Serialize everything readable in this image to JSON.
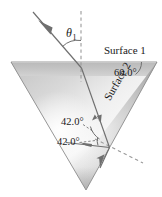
{
  "figure": {
    "canvas": {
      "width": 162,
      "height": 197
    },
    "background_color": "#ffffff"
  },
  "prism": {
    "shape": "inverted-triangle",
    "fill_light": "#f4f4f4",
    "fill_mid": "#d0d0d0",
    "fill_dark": "#a8a8a8",
    "outline_color": "#8a8a8a",
    "vertices": [
      {
        "name": "top-left",
        "x": 11,
        "y": 62
      },
      {
        "name": "top-right",
        "x": 157,
        "y": 62
      },
      {
        "name": "bottom",
        "x": 86,
        "y": 190
      }
    ]
  },
  "labels": {
    "surface_1": "Surface 1",
    "surface_2": "Surface 2",
    "angle_60": "60.0°",
    "angle_42_upper": "42.0°",
    "angle_42_lower": "42.0°",
    "theta_1_symbol": "θ",
    "theta_1_subscript": "1"
  },
  "rays": {
    "incident": {
      "name": "incident-ray",
      "from": {
        "x": 33,
        "y": 12
      },
      "to": {
        "x": 81,
        "y": 68
      },
      "arrow_at": {
        "x": 48,
        "y": 30
      },
      "color": "#6f6f6f"
    },
    "refracted_inside": {
      "name": "refracted-ray-inside-prism",
      "from": {
        "x": 81,
        "y": 68
      },
      "to": {
        "x": 109,
        "y": 147
      },
      "arrow_at": {
        "x": 98,
        "y": 117
      },
      "color": "#6f6f6f"
    },
    "reflected_inside": {
      "name": "reflected-ray-inside-prism",
      "from": {
        "x": 109,
        "y": 147
      },
      "to": {
        "x": 68,
        "y": 142
      },
      "arrow_at": {
        "x": 80,
        "y": 143
      },
      "color": "#6f6f6f"
    },
    "exit_bottom": {
      "name": "exit-ray-downward",
      "from": {
        "x": 109,
        "y": 147
      },
      "to": {
        "x": 100,
        "y": 167
      },
      "arrow_at": {
        "x": 100,
        "y": 162
      },
      "color": "#6f6f6f"
    }
  },
  "construction_lines": {
    "normal_surface_1": {
      "name": "normal-to-surface-1",
      "style": "dashed",
      "from": {
        "x": 81,
        "y": 11
      },
      "to": {
        "x": 81,
        "y": 82
      },
      "color": "#9a9a9a"
    },
    "normal_surface_2": {
      "name": "normal-to-surface-2",
      "style": "dashed",
      "from": {
        "x": 95,
        "y": 139
      },
      "to": {
        "x": 142,
        "y": 163
      },
      "color": "#9a9a9a"
    }
  },
  "arcs": {
    "theta_1_arc": {
      "name": "theta-1-angle-arc",
      "color": "#6f6f6f"
    },
    "angle_60_arc": {
      "name": "angle-60-arc",
      "color": "#6f6f6f"
    },
    "angle_42_upper_arc": {
      "name": "angle-42-upper-arc",
      "color": "#6f6f6f"
    },
    "angle_42_lower_arc": {
      "name": "angle-42-lower-arc",
      "color": "#6f6f6f"
    }
  },
  "leaders": {
    "angle_42_upper_leader": {
      "name": "angle-42-upper-leader-line"
    },
    "angle_42_lower_leader": {
      "name": "angle-42-lower-leader-line"
    }
  }
}
